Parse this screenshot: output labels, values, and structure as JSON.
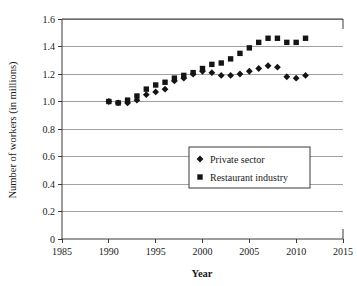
{
  "chart_data": {
    "type": "scatter",
    "title": "",
    "subtitle": "",
    "xlabel": "Year",
    "ylabel": "Number of workers (in millions)",
    "xlim": [
      1985,
      2015
    ],
    "ylim": [
      0,
      1.6
    ],
    "xticks": [
      "1985",
      "1990",
      "1995",
      "2000",
      "2005",
      "2010",
      "2015"
    ],
    "xtick_values": [
      1985,
      1990,
      1995,
      2000,
      2005,
      2010,
      2015
    ],
    "yticks": [
      "0",
      "0.2",
      "0.4",
      "0.6",
      "0.8",
      "1.0",
      "1.2",
      "1.4",
      "1.6"
    ],
    "ytick_values": [
      0,
      0.2,
      0.4,
      0.6,
      0.8,
      1.0,
      1.2,
      1.4,
      1.6
    ],
    "grid": "horizontal",
    "legend_position": "center",
    "x": [
      1990,
      1991,
      1992,
      1993,
      1994,
      1995,
      1996,
      1997,
      1998,
      1999,
      2000,
      2001,
      2002,
      2003,
      2004,
      2005,
      2006,
      2007,
      2008,
      2009,
      2010,
      2011
    ],
    "series": [
      {
        "name": "Private sector",
        "marker": "diamond",
        "color": "#141414",
        "values": [
          1.0,
          0.99,
          0.99,
          1.01,
          1.05,
          1.07,
          1.09,
          1.15,
          1.17,
          1.2,
          1.22,
          1.21,
          1.19,
          1.19,
          1.2,
          1.22,
          1.24,
          1.26,
          1.25,
          1.18,
          1.17,
          1.19
        ]
      },
      {
        "name": "Restaurant industry",
        "marker": "square",
        "color": "#141414",
        "values": [
          1.0,
          0.99,
          1.01,
          1.04,
          1.09,
          1.12,
          1.14,
          1.17,
          1.19,
          1.21,
          1.24,
          1.27,
          1.28,
          1.31,
          1.35,
          1.39,
          1.43,
          1.46,
          1.46,
          1.43,
          1.43,
          1.46
        ]
      }
    ]
  },
  "legend": {
    "items": [
      {
        "label": "Private sector",
        "marker": "diamond"
      },
      {
        "label": "Restaurant industry",
        "marker": "square"
      }
    ]
  }
}
